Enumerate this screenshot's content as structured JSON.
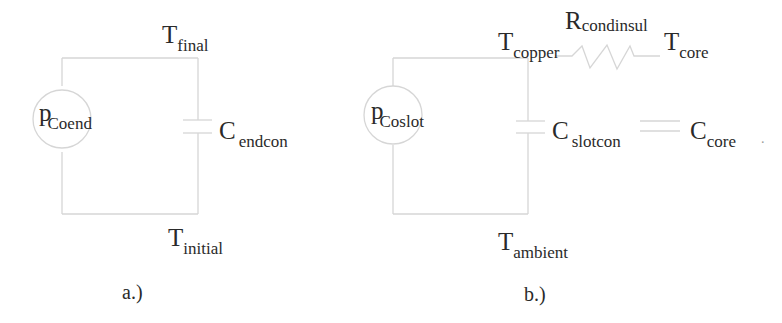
{
  "colors": {
    "wire": "#d4d4d4",
    "text": "#2a2a2a",
    "background": "#ffffff"
  },
  "diagram_a": {
    "caption": "a.)",
    "source": {
      "main": "p",
      "sub": "Coend"
    },
    "top_node": {
      "main": "T",
      "sub": "final"
    },
    "bottom_node": {
      "main": "T",
      "sub": "initial"
    },
    "capacitor": {
      "main": "C",
      "sub": "endcon"
    }
  },
  "diagram_b": {
    "caption": "b.)",
    "source": {
      "main": "p",
      "sub": "Coslot"
    },
    "top_node": {
      "main": "T",
      "sub": "copper"
    },
    "bottom_node": {
      "main": "T",
      "sub": "ambient"
    },
    "resistor": {
      "main": "R",
      "sub": "condinsul"
    },
    "resistor_end_node": {
      "main": "T",
      "sub": "core"
    },
    "capacitor_slot": {
      "main": "C",
      "sub": "slotcon"
    },
    "capacitor_core": {
      "main": "C",
      "sub": "core"
    },
    "trailing_mark": "."
  }
}
